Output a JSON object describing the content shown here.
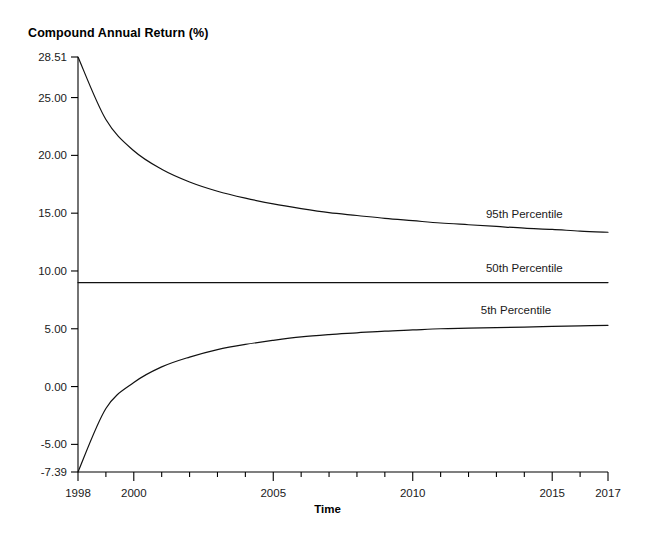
{
  "chart_data": {
    "type": "line",
    "title": "Compound Annual Return (%)",
    "xlabel": "Time",
    "ylabel": "Compound Annual Return (%)",
    "xlim": [
      1998,
      2017
    ],
    "ylim": [
      -7.39,
      28.51
    ],
    "grid": false,
    "legend_position": "inline-right-of-series",
    "x_tick_labels": [
      "1998",
      "2000",
      "2005",
      "2010",
      "2015",
      "2017"
    ],
    "x_tick_values": [
      1998,
      2000,
      2005,
      2010,
      2015,
      2017
    ],
    "x_minor_ticks": [
      1999,
      2001,
      2002,
      2003,
      2004,
      2006,
      2007,
      2008,
      2009,
      2011,
      2012,
      2013,
      2014,
      2016
    ],
    "y_tick_labels": [
      "28.51",
      "25.00",
      "20.00",
      "15.00",
      "10.00",
      "5.00",
      "0.00",
      "-5.00",
      "-7.39"
    ],
    "y_tick_values": [
      28.51,
      25.0,
      20.0,
      15.0,
      10.0,
      5.0,
      0.0,
      -5.0,
      -7.39
    ],
    "x": [
      1998,
      1999,
      2000,
      2001,
      2002,
      2003,
      2004,
      2005,
      2006,
      2007,
      2008,
      2009,
      2010,
      2011,
      2012,
      2013,
      2014,
      2015,
      2016,
      2017
    ],
    "series": [
      {
        "name": "95th Percentile",
        "color": "#111111",
        "values": [
          28.51,
          23.1,
          20.4,
          18.8,
          17.7,
          16.9,
          16.3,
          15.8,
          15.4,
          15.05,
          14.8,
          14.55,
          14.35,
          14.15,
          14.0,
          13.85,
          13.7,
          13.6,
          13.45,
          13.35
        ]
      },
      {
        "name": "50th Percentile",
        "color": "#111111",
        "values": [
          9.0,
          9.0,
          9.0,
          9.0,
          9.0,
          9.0,
          9.0,
          9.0,
          9.0,
          9.0,
          9.0,
          9.0,
          9.0,
          9.0,
          9.0,
          9.0,
          9.0,
          9.0,
          9.0,
          9.0
        ]
      },
      {
        "name": "5th Percentile",
        "color": "#111111",
        "values": [
          -7.39,
          -1.9,
          0.35,
          1.7,
          2.55,
          3.2,
          3.65,
          4.0,
          4.3,
          4.5,
          4.65,
          4.8,
          4.9,
          5.0,
          5.05,
          5.1,
          5.15,
          5.2,
          5.25,
          5.3
        ]
      }
    ],
    "annotations": [
      {
        "text": "95th Percentile",
        "x": 2014.0,
        "y": 14.6
      },
      {
        "text": "50th Percentile",
        "x": 2014.0,
        "y": 9.9
      },
      {
        "text": "5th Percentile",
        "x": 2013.7,
        "y": 6.3
      }
    ]
  }
}
